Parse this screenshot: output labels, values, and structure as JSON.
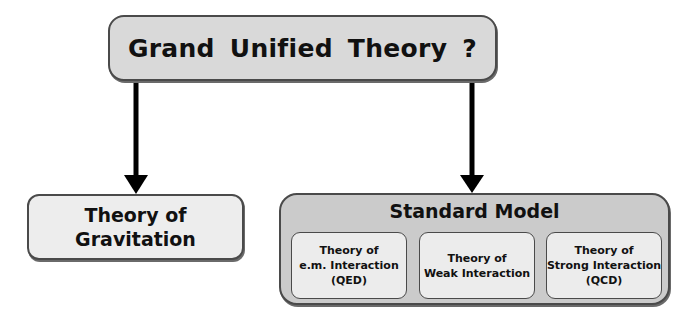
{
  "diagram": {
    "top": {
      "label": "Grand Unified Theory ?"
    },
    "gravitation": {
      "lines": [
        "Theory of",
        "Gravitation"
      ]
    },
    "standard_model": {
      "title": "Standard Model",
      "components": [
        {
          "lines": [
            "Theory of",
            "e.m. Interaction",
            "(QED)"
          ]
        },
        {
          "lines": [
            "Theory of",
            "Weak Interaction"
          ]
        },
        {
          "lines": [
            "Theory of",
            "Strong Interaction",
            "(QCD)"
          ]
        }
      ]
    },
    "edges": [
      {
        "from": "Grand Unified Theory ?",
        "to": "Theory of Gravitation"
      },
      {
        "from": "Grand Unified Theory ?",
        "to": "Standard Model"
      }
    ],
    "colors": {
      "top_fill": "#d9d9d9",
      "gravitation_fill": "#ededed",
      "standard_model_fill": "#cbcbcb",
      "inner_fill": "#ececec",
      "border": "#4a4a4a",
      "arrow": "#000000"
    }
  }
}
